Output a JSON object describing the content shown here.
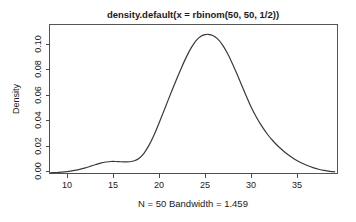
{
  "chart_data": {
    "type": "line",
    "title": "density.default(x = rbinom(50, 50, 1/2))",
    "subtitle": "N = 50   Bandwidth = 1.459",
    "xlabel": "",
    "ylabel": "Density",
    "xlim": [
      8.5,
      39.0
    ],
    "ylim": [
      0.0,
      0.1215
    ],
    "grid": false,
    "legend": null,
    "xticks": [
      10,
      15,
      20,
      25,
      30,
      35
    ],
    "xtick_labels": [
      "10",
      "15",
      "20",
      "25",
      "30",
      "35"
    ],
    "yticks": [
      0.0,
      0.02,
      0.04,
      0.06,
      0.08,
      0.1
    ],
    "ytick_labels": [
      "0.00",
      "0.02",
      "0.04",
      "0.06",
      "0.08",
      "0.10"
    ],
    "series": [
      {
        "name": "density",
        "x": [
          8.62,
          9.2,
          9.8,
          10.4,
          11.0,
          11.6,
          12.2,
          12.8,
          13.4,
          14.0,
          14.5,
          15.0,
          15.5,
          16.0,
          16.5,
          17.0,
          17.5,
          18.0,
          18.5,
          19.0,
          19.5,
          20.0,
          20.5,
          21.0,
          21.5,
          22.0,
          22.5,
          23.0,
          23.5,
          24.0,
          24.5,
          25.0,
          25.3,
          25.8,
          26.3,
          26.8,
          27.3,
          27.8,
          28.3,
          28.8,
          29.3,
          29.8,
          30.4,
          31.0,
          31.6,
          32.2,
          32.8,
          33.4,
          34.0,
          34.6,
          35.2,
          35.8,
          36.4,
          37.0,
          37.6,
          38.2,
          38.7
        ],
        "y": [
          0.0006,
          0.0008,
          0.0011,
          0.0016,
          0.0023,
          0.0032,
          0.0044,
          0.0058,
          0.0073,
          0.0087,
          0.0094,
          0.0098,
          0.0098,
          0.0096,
          0.0095,
          0.0096,
          0.0104,
          0.0125,
          0.0165,
          0.0225,
          0.0302,
          0.0392,
          0.0488,
          0.0586,
          0.0683,
          0.0777,
          0.0867,
          0.0951,
          0.1024,
          0.1082,
          0.1118,
          0.1133,
          0.1135,
          0.1125,
          0.1098,
          0.1051,
          0.0986,
          0.0908,
          0.0821,
          0.0729,
          0.0638,
          0.0551,
          0.0461,
          0.0384,
          0.0318,
          0.0263,
          0.0216,
          0.0176,
          0.0141,
          0.0111,
          0.0086,
          0.0065,
          0.0048,
          0.0035,
          0.0025,
          0.0018,
          0.0014
        ]
      }
    ]
  },
  "axis": {
    "ylabel": "Density",
    "ytick_labels": [
      "0.00",
      "0.02",
      "0.04",
      "0.06",
      "0.08",
      "0.10"
    ],
    "xtick_labels": [
      "10",
      "15",
      "20",
      "25",
      "30",
      "35"
    ]
  },
  "text": {
    "title": "density.default(x = rbinom(50, 50, 1/2))",
    "subtitle": "N = 50   Bandwidth = 1.459"
  },
  "colors": {
    "curve": "#3a3a3a",
    "axis": "#4d4d4d",
    "box": "#555555",
    "background": "#ffffff",
    "text": "#1a1a1a"
  }
}
